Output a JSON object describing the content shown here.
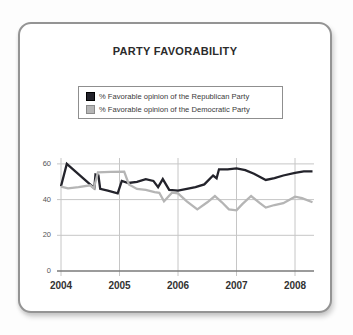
{
  "panel": {
    "title": "PARTY FAVORABILITY"
  },
  "legend": {
    "items": [
      {
        "label": "% Favorable opinion of the Republican Party",
        "color": "#23232b",
        "border": "#000000"
      },
      {
        "label": "% Favorable opinion of the Democratic Party",
        "color": "#b5b5b5",
        "border": "#8a8a8a"
      }
    ]
  },
  "chart_data": {
    "type": "line",
    "title": "PARTY FAVORABILITY",
    "xlabel": "",
    "ylabel": "",
    "x_ticks": [
      2004,
      2005,
      2006,
      2007,
      2008
    ],
    "y_ticks": [
      0,
      20,
      40,
      60
    ],
    "xlim": [
      2004,
      2008.35
    ],
    "ylim": [
      0,
      65
    ],
    "grid": true,
    "legend_position": "top-center",
    "colors": {
      "grid": "#c6c6c6",
      "axis": "#7a7a7a"
    },
    "series": [
      {
        "name": "% Favorable opinion of the Republican Party",
        "color": "#23232b",
        "points": [
          [
            2004.0,
            47.5
          ],
          [
            2004.1,
            60
          ],
          [
            2004.55,
            47
          ],
          [
            2004.57,
            46.5
          ],
          [
            2004.59,
            54
          ],
          [
            2004.64,
            53.5
          ],
          [
            2004.67,
            46
          ],
          [
            2004.8,
            45
          ],
          [
            2004.97,
            43.5
          ],
          [
            2005.04,
            50.5
          ],
          [
            2005.15,
            49.3
          ],
          [
            2005.3,
            50
          ],
          [
            2005.45,
            51.5
          ],
          [
            2005.58,
            50.5
          ],
          [
            2005.66,
            47
          ],
          [
            2005.74,
            51.5
          ],
          [
            2005.85,
            45.5
          ],
          [
            2006.0,
            45
          ],
          [
            2006.15,
            46
          ],
          [
            2006.3,
            47
          ],
          [
            2006.45,
            48.5
          ],
          [
            2006.6,
            53.5
          ],
          [
            2006.66,
            52
          ],
          [
            2006.7,
            57
          ],
          [
            2006.85,
            57
          ],
          [
            2007.0,
            57.5
          ],
          [
            2007.15,
            56.5
          ],
          [
            2007.3,
            54.5
          ],
          [
            2007.5,
            51
          ],
          [
            2007.65,
            52
          ],
          [
            2007.8,
            53.5
          ],
          [
            2008.0,
            55
          ],
          [
            2008.15,
            55.8
          ],
          [
            2008.3,
            55.8
          ]
        ]
      },
      {
        "name": "% Favorable opinion of the Democratic Party",
        "color": "#b5b5b5",
        "points": [
          [
            2004.0,
            47.3
          ],
          [
            2004.12,
            46.3
          ],
          [
            2004.3,
            47
          ],
          [
            2004.5,
            48
          ],
          [
            2004.56,
            46.3
          ],
          [
            2004.63,
            55.3
          ],
          [
            2004.85,
            55.5
          ],
          [
            2005.08,
            55.7
          ],
          [
            2005.16,
            48.5
          ],
          [
            2005.3,
            46
          ],
          [
            2005.45,
            45.5
          ],
          [
            2005.6,
            44.2
          ],
          [
            2005.68,
            43.8
          ],
          [
            2005.76,
            39
          ],
          [
            2005.9,
            44
          ],
          [
            2006.0,
            43.5
          ],
          [
            2006.15,
            39
          ],
          [
            2006.33,
            34.5
          ],
          [
            2006.5,
            38.5
          ],
          [
            2006.63,
            42
          ],
          [
            2006.75,
            38.5
          ],
          [
            2006.87,
            34.5
          ],
          [
            2007.0,
            34
          ],
          [
            2007.1,
            37.5
          ],
          [
            2007.25,
            42
          ],
          [
            2007.4,
            38
          ],
          [
            2007.5,
            35.5
          ],
          [
            2007.65,
            37
          ],
          [
            2007.8,
            38
          ],
          [
            2008.0,
            41.6
          ],
          [
            2008.12,
            40.8
          ],
          [
            2008.3,
            38.5
          ]
        ]
      }
    ]
  }
}
